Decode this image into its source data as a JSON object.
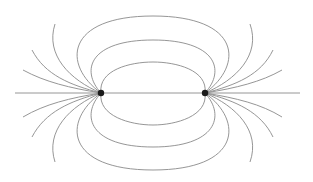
{
  "diagram": {
    "type": "electric-dipole-field-lines",
    "colors": {
      "background": "#ffffff",
      "field_line": "#8a8a8a",
      "charge": "#1a1a1a"
    },
    "charges": [
      {
        "name": "left-charge",
        "x": 101,
        "y": 93,
        "r": 3.2
      },
      {
        "name": "right-charge",
        "x": 205,
        "y": 93,
        "r": 3.2
      }
    ],
    "axis": {
      "x1": 15,
      "y1": 93,
      "x2": 300,
      "y2": 93
    },
    "closed_loops": [
      {
        "name": "inner-loop-top",
        "d": "M101,93 C98,70 130,62 153,62 C176,62 208,70 205,93"
      },
      {
        "name": "middle-loop-top",
        "d": "M101,93 C80,70 90,40 153,40 C216,40 226,70 205,93"
      },
      {
        "name": "outer-loop-top",
        "d": "M101,93 C62,65 65,16 153,16 C241,16 244,65 205,93"
      },
      {
        "name": "inner-loop-bottom",
        "d": "M101,93 C98,116 130,125 153,125 C176,125 208,116 205,93"
      },
      {
        "name": "middle-loop-bottom",
        "d": "M101,93 C80,116 90,147 153,147 C216,147 226,116 205,93"
      },
      {
        "name": "outer-loop-bottom",
        "d": "M101,93 C62,121 65,170 153,170 C241,170 244,121 205,93"
      }
    ],
    "open_lines": [
      {
        "name": "left-open-top-1",
        "d": "M101,93 C70,80 45,55 55,24"
      },
      {
        "name": "left-open-top-2",
        "d": "M101,93 C70,85 45,75 32,50"
      },
      {
        "name": "left-open-top-3",
        "d": "M101,93 C70,88 45,82 23,70"
      },
      {
        "name": "left-open-bottom-1",
        "d": "M101,93 C70,98 45,104 23,117"
      },
      {
        "name": "left-open-bottom-2",
        "d": "M101,93 C70,101 45,112 32,137"
      },
      {
        "name": "left-open-bottom-3",
        "d": "M101,93 C70,106 45,131 55,162"
      },
      {
        "name": "right-open-top-1",
        "d": "M205,93 C236,80 261,55 250,24"
      },
      {
        "name": "right-open-top-2",
        "d": "M205,93 C236,85 261,75 273,50"
      },
      {
        "name": "right-open-top-3",
        "d": "M205,93 C236,88 261,82 282,70"
      },
      {
        "name": "right-open-bottom-1",
        "d": "M205,93 C236,98 261,104 282,117"
      },
      {
        "name": "right-open-bottom-2",
        "d": "M205,93 C236,101 261,112 273,137"
      },
      {
        "name": "right-open-bottom-3",
        "d": "M205,93 C236,106 261,131 250,162"
      }
    ]
  }
}
